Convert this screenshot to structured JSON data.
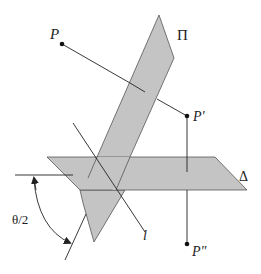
{
  "figure": {
    "colors": {
      "plane_fill": "#c4c4c4",
      "plane_stroke": "#555555",
      "line": "#222222",
      "background": "#ffffff"
    },
    "labels": {
      "point_p": "P",
      "point_p_prime": "P'",
      "point_p_double_prime": "P\"",
      "plane_pi": "Π",
      "plane_delta": "Δ",
      "line_l": "l",
      "angle": "θ/2"
    }
  }
}
